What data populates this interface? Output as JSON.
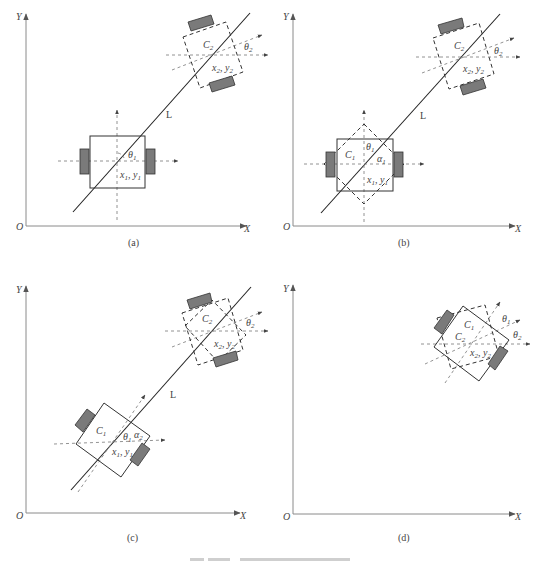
{
  "figure": {
    "panels": [
      {
        "id": "a",
        "caption": "(a)",
        "axes": {
          "origin": "O",
          "x": "X",
          "y": "Y"
        },
        "line_label": "L",
        "robot1": {
          "center_label": "x1, y1",
          "angle_label": "θ1"
        },
        "robot2": {
          "name": "C2",
          "center_label": "x2, y2",
          "angle_label": "θ2"
        }
      },
      {
        "id": "b",
        "caption": "(b)",
        "axes": {
          "origin": "O",
          "x": "X",
          "y": "Y"
        },
        "line_label": "L",
        "robot1": {
          "name": "C1",
          "center_label": "x1, y1",
          "angle_label": "θ1",
          "alpha_label": "α1"
        },
        "robot2": {
          "name": "C2",
          "center_label": "x2, y2",
          "angle_label": "θ2"
        }
      },
      {
        "id": "c",
        "caption": "(c)",
        "axes": {
          "origin": "O",
          "x": "X",
          "y": "Y"
        },
        "line_label": "L",
        "robot1": {
          "name": "C1",
          "center_label": "x1, y1",
          "angle_label": "θ1",
          "alpha_label": "α2"
        },
        "robot2": {
          "name": "C2",
          "center_label": "x2, y2",
          "angle_label": "θ2"
        }
      },
      {
        "id": "d",
        "caption": "(d)",
        "axes": {
          "origin": "O",
          "x": "X",
          "y": "Y"
        },
        "robot1": {
          "name": "C1",
          "angle_label": "θ1"
        },
        "robot2": {
          "name": "C2",
          "center_label": "x2, y2",
          "angle_label": "θ2"
        }
      }
    ],
    "colors": {
      "axis": "#8a8a8a",
      "wheel": "#7a7a7a",
      "stroke": "#333333"
    }
  }
}
